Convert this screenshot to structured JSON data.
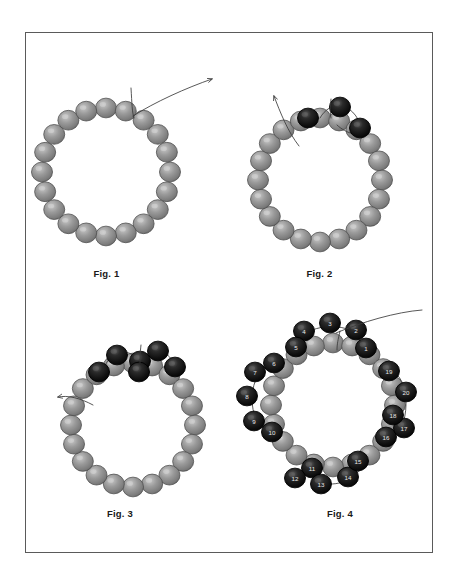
{
  "page": {
    "background_color": "#ffffff",
    "border_color": "#5a5a5a",
    "sheet": {
      "x": 25,
      "y": 32,
      "width": 408,
      "height": 521
    }
  },
  "palette": {
    "gray_bead_fill": "#8d8d8d",
    "gray_bead_light": "#b9b9b9",
    "gray_bead_dark": "#636363",
    "gray_bead_edge": "#4f4f4f",
    "black_bead_fill": "#141414",
    "black_bead_light": "#585858",
    "black_bead_dark": "#000000",
    "black_bead_edge": "#000000",
    "thread_color": "#3a3a3a",
    "number_color": "#e8e8e8",
    "caption_color": "#1a1a1a"
  },
  "figures": [
    {
      "id": "fig1",
      "caption": "Fig. 1",
      "description": "Base ring of gray seed beads with thread exiting at top and needle arrow pointing up-right",
      "center": {
        "x": 106,
        "y": 172
      },
      "ring_radius": 64,
      "gray_bead_count": 20,
      "black_bead_count": 0,
      "bead_radius": 10.5,
      "thread": {
        "tail_start": {
          "x": 131,
          "y": 88
        },
        "arrow_end": {
          "x": 214,
          "y": 78
        },
        "direction": "up-right"
      },
      "numbered_beads": []
    },
    {
      "id": "fig2",
      "caption": "Fig. 2",
      "description": "Ring with first group of three black beads added at the upper right, thread arrow pointing up-left",
      "center": {
        "x": 320,
        "y": 180
      },
      "ring_radius": 62,
      "gray_bead_count": 20,
      "black_bead_count": 3,
      "bead_radius": 10.5,
      "thread": {
        "tail_start": {
          "x": 299,
          "y": 145
        },
        "arrow_end": {
          "x": 272,
          "y": 93
        },
        "direction": "up-left"
      },
      "numbered_beads": []
    },
    {
      "id": "fig3",
      "caption": "Fig. 3",
      "description": "Ring with two adjacent black bead clusters across the top, thread tail exiting to the left",
      "center": {
        "x": 133,
        "y": 425
      },
      "ring_radius": 62,
      "gray_bead_count": 20,
      "black_bead_count": 6,
      "bead_radius": 10.5,
      "thread": {
        "tail_start": {
          "x": 92,
          "y": 404
        },
        "arrow_end": {
          "x": 57,
          "y": 398
        },
        "direction": "left"
      },
      "numbered_beads": []
    },
    {
      "id": "fig4",
      "caption": "Fig. 4",
      "description": "Completed ring with four numbered black bead clusters (1-20) around the gray base ring, thread exiting to upper right",
      "center": {
        "x": 333,
        "y": 405
      },
      "ring_radius": 62,
      "gray_bead_count": 20,
      "black_bead_count": 20,
      "bead_radius": 10.5,
      "thread": {
        "tail_start": {
          "x": 340,
          "y": 330
        },
        "arrow_end": {
          "x": 421,
          "y": 311
        },
        "direction": "up-right"
      },
      "numbered_beads": [
        {
          "n": "1",
          "cluster": "top",
          "x": 366,
          "y": 348
        },
        {
          "n": "2",
          "cluster": "top",
          "x": 356,
          "y": 330
        },
        {
          "n": "3",
          "cluster": "top",
          "x": 330,
          "y": 323
        },
        {
          "n": "4",
          "cluster": "top",
          "x": 304,
          "y": 331
        },
        {
          "n": "5",
          "cluster": "top",
          "x": 296,
          "y": 347
        },
        {
          "n": "6",
          "cluster": "left",
          "x": 274,
          "y": 363
        },
        {
          "n": "7",
          "cluster": "left",
          "x": 255,
          "y": 372
        },
        {
          "n": "8",
          "cluster": "left",
          "x": 247,
          "y": 396
        },
        {
          "n": "9",
          "cluster": "left",
          "x": 254,
          "y": 421
        },
        {
          "n": "10",
          "cluster": "left",
          "x": 272,
          "y": 432
        },
        {
          "n": "11",
          "cluster": "bottom",
          "x": 312,
          "y": 468
        },
        {
          "n": "12",
          "cluster": "bottom",
          "x": 295,
          "y": 478
        },
        {
          "n": "13",
          "cluster": "bottom",
          "x": 321,
          "y": 484
        },
        {
          "n": "14",
          "cluster": "bottom",
          "x": 348,
          "y": 477
        },
        {
          "n": "15",
          "cluster": "bottom",
          "x": 358,
          "y": 461
        },
        {
          "n": "16",
          "cluster": "right",
          "x": 386,
          "y": 437
        },
        {
          "n": "17",
          "cluster": "right",
          "x": 404,
          "y": 428
        },
        {
          "n": "18",
          "cluster": "right",
          "x": 393,
          "y": 415
        },
        {
          "n": "19",
          "cluster": "right",
          "x": 389,
          "y": 371
        },
        {
          "n": "20",
          "cluster": "right",
          "x": 406,
          "y": 392
        }
      ]
    }
  ]
}
